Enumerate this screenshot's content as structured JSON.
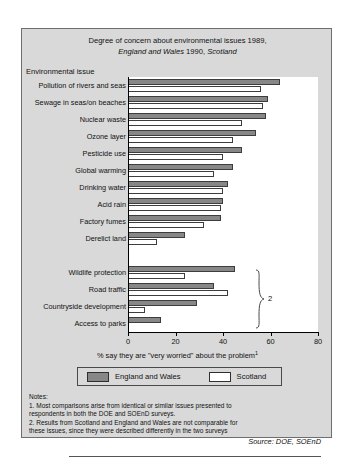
{
  "figure": {
    "title_line1": "Degree of concern about environmental issues 1989,",
    "title_line2_a": "England and Wales",
    "title_line2_b": " 1990, ",
    "title_line2_c": "Scotland",
    "category_axis_header": "Environmental issue",
    "bracket_label": "2",
    "source": "Source: DOE, SOEnD"
  },
  "legend": {
    "series1_label": "England and Wales",
    "series2_label": "Scotland"
  },
  "notes": {
    "heading": "Notes:",
    "line1": "1.  Most comparisons arise from identical or similar issues  presented to",
    "line2": "respondents in both the DOE and SOEnD surveys.",
    "line3": "2.  Results from Scotland and England and Wales are not comparable for",
    "line4": "these issues, since they were described differently in the two surveys"
  },
  "colors": {
    "series1_fill": "#878787",
    "series2_fill": "#ffffff",
    "panel_background": "#d9d9d9",
    "plot_background": "#ffffff",
    "outline": "#3d3d3d"
  },
  "chart_data": {
    "type": "bar",
    "orientation": "horizontal",
    "title": "Degree of concern about environmental issues 1989, England and Wales 1990, Scotland",
    "xlabel": "% say they are \"very worried\" about the problem",
    "ylabel": "Environmental issue",
    "xlim": [
      0,
      80
    ],
    "xticks": [
      0,
      20,
      40,
      60,
      80
    ],
    "grid": false,
    "legend_position": "below-axis",
    "categories": [
      "Pollution of rivers and seas",
      "Sewage in seas/on beaches",
      "Nuclear waste",
      "Ozone layer",
      "Pesticide use",
      "Global warming",
      "Drinking water",
      "Acid rain",
      "Factory fumes",
      "Derelict land",
      "",
      "Wildlife protection",
      "Road traffic",
      "Countryside development",
      "Access to parks"
    ],
    "series": [
      {
        "name": "England and Wales",
        "values": [
          64,
          59,
          58,
          54,
          48,
          44,
          42,
          40,
          39,
          24,
          null,
          45,
          36,
          29,
          14
        ]
      },
      {
        "name": "Scotland",
        "values": [
          56,
          57,
          48,
          44,
          40,
          36,
          40,
          39,
          32,
          12,
          null,
          24,
          42,
          7,
          null
        ]
      }
    ],
    "annotations": [
      {
        "text": "2",
        "type": "brace",
        "applies_to": [
          "Wildlife protection",
          "Road traffic",
          "Countryside development",
          "Access to parks"
        ]
      }
    ]
  }
}
